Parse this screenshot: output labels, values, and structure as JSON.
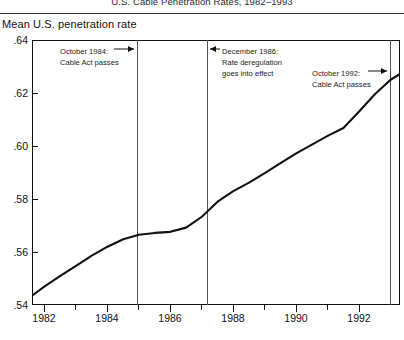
{
  "figure": {
    "title": "U.S. Cable Penetration Rates, 1982–1993",
    "y_axis_caption": "Mean U.S. penetration rate"
  },
  "chart_data": {
    "type": "line",
    "title": "U.S. Cable Penetration Rates, 1982–1993",
    "xlabel": "",
    "ylabel": "Mean U.S. penetration rate",
    "xlim": [
      1981.6,
      1993.3
    ],
    "ylim": [
      0.54,
      0.64
    ],
    "grid": false,
    "legend": "none",
    "ytick_labels": [
      ".64",
      ".62",
      ".60",
      ".58",
      ".56",
      ".54"
    ],
    "ytick_values": [
      0.64,
      0.62,
      0.6,
      0.58,
      0.56,
      0.54
    ],
    "xtick_labels": [
      "1982",
      "1984",
      "1986",
      "1988",
      "1990",
      "1992"
    ],
    "xtick_values": [
      1982,
      1984,
      1986,
      1988,
      1990,
      1992
    ],
    "xtick_minor_values": [
      1983,
      1985,
      1987,
      1989,
      1991,
      1993
    ],
    "series": [
      {
        "name": "Mean U.S. penetration rate",
        "x": [
          1981.6,
          1982.0,
          1982.5,
          1983.0,
          1983.5,
          1984.0,
          1984.5,
          1985.0,
          1985.5,
          1986.0,
          1986.5,
          1987.0,
          1987.5,
          1988.0,
          1988.5,
          1989.0,
          1989.5,
          1990.0,
          1990.5,
          1991.0,
          1991.5,
          1992.0,
          1992.5,
          1993.0,
          1993.3
        ],
        "y": [
          0.5435,
          0.547,
          0.551,
          0.5548,
          0.5586,
          0.562,
          0.5648,
          0.5665,
          0.5672,
          0.5676,
          0.5692,
          0.5733,
          0.579,
          0.583,
          0.5862,
          0.5898,
          0.5935,
          0.5972,
          0.6005,
          0.6038,
          0.6068,
          0.613,
          0.6195,
          0.625,
          0.6272
        ]
      }
    ],
    "annotations": [
      {
        "id": "oct-1984",
        "lines": [
          "October 1984:",
          "Cable Act passes"
        ],
        "arrow": "right",
        "event_x": 1984.78
      },
      {
        "id": "dec-1986",
        "lines": [
          "December 1986:",
          "Rate deregulation",
          "goes into effect"
        ],
        "arrow": "left",
        "event_x": 1986.95
      },
      {
        "id": "oct-1992",
        "lines": [
          "October 1992:",
          "Cable Act passes"
        ],
        "arrow": "right",
        "event_x": 1992.78
      }
    ],
    "event_lines": [
      1984.78,
      1986.95,
      1992.78
    ]
  },
  "ticks": {
    "y": [
      {
        "label": ".64",
        "top": 40
      },
      {
        "label": ".62",
        "top": 93
      },
      {
        "label": ".60",
        "top": 146
      },
      {
        "label": ".58",
        "top": 199
      },
      {
        "label": ".56",
        "top": 252
      },
      {
        "label": ".54",
        "top": 305
      }
    ],
    "x_major": [
      {
        "label": "1982",
        "left": 44
      },
      {
        "label": "1984",
        "left": 107
      },
      {
        "label": "1986",
        "left": 170
      },
      {
        "label": "1988",
        "left": 233
      },
      {
        "label": "1990",
        "left": 296
      },
      {
        "label": "1992",
        "left": 359
      }
    ],
    "x_minor": [
      75,
      138,
      201,
      264,
      327,
      390
    ]
  },
  "annotation_boxes": [
    {
      "id": "oct-1984",
      "left": 60,
      "top": 46,
      "lines": [
        "October 1984:",
        "Cable Act passes"
      ]
    },
    {
      "id": "dec-1986",
      "left": 222,
      "top": 46,
      "lines": [
        "December 1986:",
        "Rate deregulation",
        "goes into effect"
      ]
    },
    {
      "id": "oct-1992",
      "left": 312,
      "top": 68,
      "lines": [
        "October 1992:",
        "Cable Act passes"
      ]
    }
  ]
}
